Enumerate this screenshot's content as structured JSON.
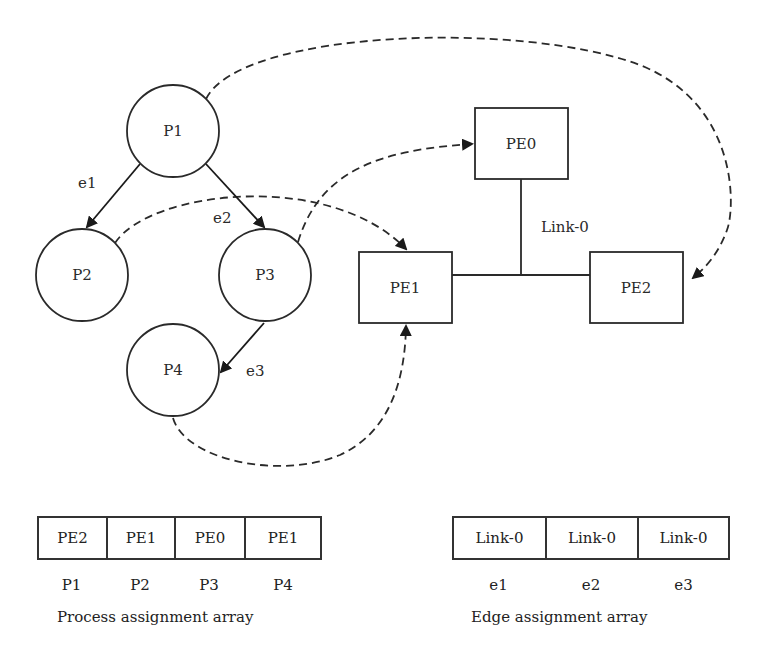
{
  "diagram": {
    "processes": [
      {
        "id": "P1",
        "label": "P1",
        "cx": 173,
        "cy": 131
      },
      {
        "id": "P2",
        "label": "P2",
        "cx": 82,
        "cy": 275
      },
      {
        "id": "P3",
        "label": "P3",
        "cx": 265,
        "cy": 275
      },
      {
        "id": "P4",
        "label": "P4",
        "cx": 173,
        "cy": 370
      }
    ],
    "processing_elements": [
      {
        "id": "PE0",
        "label": "PE0"
      },
      {
        "id": "PE1",
        "label": "PE1"
      },
      {
        "id": "PE2",
        "label": "PE2"
      }
    ],
    "edges": [
      {
        "id": "e1",
        "label": "e1",
        "from": "P1",
        "to": "P2"
      },
      {
        "id": "e2",
        "label": "e2",
        "from": "P1",
        "to": "P3"
      },
      {
        "id": "e3",
        "label": "e3",
        "from": "P3",
        "to": "P4"
      }
    ],
    "link_label": "Link-0",
    "mappings": [
      {
        "process": "P1",
        "pe": "PE2"
      },
      {
        "process": "P2",
        "pe": "PE1"
      },
      {
        "process": "P3",
        "pe": "PE0"
      },
      {
        "process": "P4",
        "pe": "PE1"
      }
    ]
  },
  "process_assignment": {
    "values": [
      "PE2",
      "PE1",
      "PE0",
      "PE1"
    ],
    "indices": [
      "P1",
      "P2",
      "P3",
      "P4"
    ],
    "caption": "Process assignment array"
  },
  "edge_assignment": {
    "values": [
      "Link-0",
      "Link-0",
      "Link-0"
    ],
    "indices": [
      "e1",
      "e2",
      "e3"
    ],
    "caption": "Edge assignment array"
  }
}
